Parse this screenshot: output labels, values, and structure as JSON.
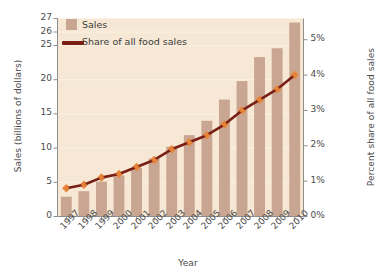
{
  "chart_data": {
    "type": "bar",
    "title": "",
    "xlabel": "Year",
    "ylabel": "Sales (billions of dollars)",
    "ylabel_right": "Percent share of all food sales",
    "categories": [
      "1997",
      "1998",
      "1999",
      "2000",
      "2001",
      "2002",
      "2003",
      "2004",
      "2005",
      "2006",
      "2007",
      "2008",
      "2009",
      "2010"
    ],
    "grid": true,
    "legend_position": "top-left",
    "axis_break_note": "Left axis is compressed between 25 and 27",
    "yticks_left": [
      "0",
      "5",
      "10",
      "15",
      "20",
      "25",
      "26",
      "27"
    ],
    "ytick_left_values": [
      0,
      5,
      10,
      15,
      20,
      25,
      26,
      27
    ],
    "ylim_left": [
      0,
      27
    ],
    "yticks_right": [
      "0%",
      "1%",
      "2%",
      "3%",
      "4%",
      "5%"
    ],
    "ytick_right_values": [
      0,
      1,
      2,
      3,
      4,
      5
    ],
    "ylim_right": [
      0,
      5.6
    ],
    "series": [
      {
        "name": "Sales",
        "type": "bar",
        "axis": "left",
        "unit": "billions of dollars",
        "color": "#c9a692",
        "values": [
          2.9,
          3.7,
          5.1,
          6.0,
          7.1,
          8.5,
          10.2,
          11.9,
          14.0,
          17.1,
          19.8,
          23.3,
          24.6,
          26.7
        ]
      },
      {
        "name": "Share of all food sales",
        "type": "line",
        "axis": "right",
        "unit": "percent",
        "color": "#7a1f16",
        "marker_color": "#e8863a",
        "values": [
          0.8,
          0.9,
          1.1,
          1.2,
          1.4,
          1.6,
          1.9,
          2.1,
          2.3,
          2.6,
          3.0,
          3.3,
          3.6,
          4.0
        ]
      }
    ]
  },
  "legend": {
    "items": [
      {
        "label": "Sales",
        "kind": "swatch",
        "color": "#c9a692"
      },
      {
        "label": "Share of all food sales",
        "kind": "line",
        "color": "#7a1f16"
      }
    ]
  },
  "colors": {
    "plot_background": "#f7e8d5",
    "bar": "#c9a692",
    "line": "#7a1f16",
    "marker": "#e8863a",
    "gridline": "#fbf1e4",
    "axis": "#8d8d8d",
    "page_background": "#ffffff"
  }
}
